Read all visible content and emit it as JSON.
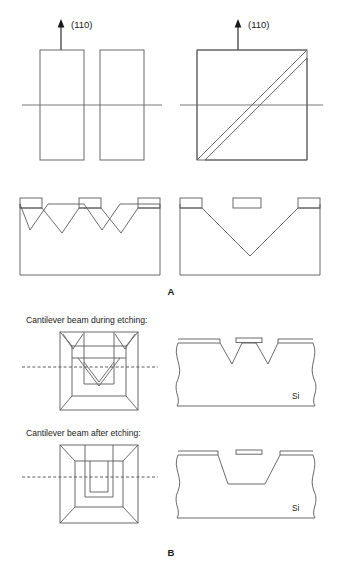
{
  "figure": {
    "panels": [
      {
        "id": "A",
        "label": "A"
      },
      {
        "id": "B",
        "label": "B"
      }
    ],
    "colors": {
      "line": "#5a5a5a",
      "arrow": "#1a1a1a",
      "text": "#1a1a1a",
      "background": "#ffffff",
      "dashed": "#4a4a4a"
    }
  },
  "panel_a": {
    "label": "A",
    "top_left_view": {
      "name": "aligned-mask-top-view",
      "direction_label": "(110)",
      "mask_openings": 2,
      "description": "Two vertical rectangular mask windows aligned with the (110) direction, bisected by a horizontal reference line"
    },
    "top_right_view": {
      "name": "rotated-mask-top-view",
      "direction_label": "(110)",
      "mask_openings": 2,
      "description": "Square outline with two parallel diagonal mask windows at 45 degrees to the (110) direction, bisected by a horizontal reference line"
    },
    "bottom_left_view": {
      "name": "aligned-cross-section",
      "mask_strips": 3,
      "grooves": 2,
      "description": "Cross section showing two separate V-grooves beneath aligned mask strips"
    },
    "bottom_right_view": {
      "name": "rotated-cross-section",
      "mask_strips": 3,
      "grooves": 1,
      "description": "Cross section showing one large merged V-groove with a free-standing central mask strip"
    }
  },
  "panel_b": {
    "label": "B",
    "stages": [
      {
        "id": "during",
        "caption": "Cantilever beam during etching:",
        "top_view": {
          "name": "cantilever-top-view-during",
          "description": "Top view of partially etched pit with U-shaped cantilever outline and V-shaped etch fronts"
        },
        "cross_section": {
          "name": "cantilever-cross-section-during",
          "material_label": "Si",
          "grooves": 2,
          "mask_strips": 3,
          "description": "Cross section with two V-grooves either side of the suspended beam, broken-away edges"
        }
      },
      {
        "id": "after",
        "caption": "Cantilever beam after etching:",
        "top_view": {
          "name": "cantilever-top-view-after",
          "description": "Top view of fully etched pyramidal pit with rectangular released cantilever beam"
        },
        "cross_section": {
          "name": "cantilever-cross-section-after",
          "material_label": "Si",
          "grooves": 1,
          "mask_strips": 3,
          "description": "Cross section with single flat-bottomed trapezoidal cavity and fully released beam"
        }
      }
    ]
  }
}
